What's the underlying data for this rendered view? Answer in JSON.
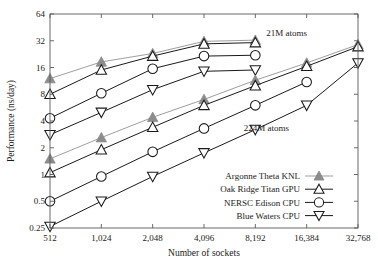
{
  "chart_data": {
    "type": "line",
    "title": "",
    "xlabel": "Number of sockets",
    "ylabel": "Performance (ns/day)",
    "xscale": "log2",
    "yscale": "log2",
    "xlim": [
      512,
      32768
    ],
    "ylim": [
      0.25,
      64
    ],
    "grid": false,
    "legend_position": "lower-right",
    "xticks": [
      512,
      1024,
      2048,
      4096,
      8192,
      16384,
      32768
    ],
    "xtick_labels": [
      "512",
      "1,024",
      "2,048",
      "4,096",
      "8,192",
      "16,384",
      "32,768"
    ],
    "yticks": [
      0.25,
      0.5,
      1,
      2,
      4,
      8,
      16,
      32,
      64
    ],
    "ytick_labels": [
      "0.25",
      "0.5",
      "1",
      "2",
      "4",
      "8",
      "16",
      "32",
      "64"
    ],
    "annotations": [
      {
        "text": "21M atoms",
        "x": 9500,
        "y": 36
      },
      {
        "text": "224M atoms",
        "x": 7000,
        "y": 3.1
      }
    ],
    "series": [
      {
        "name": "Argonne Theta KNL",
        "marker": "filled-triangle-up",
        "color": "#8c8c8c",
        "dataset": "21M atoms",
        "x": [
          512,
          1024,
          2048,
          4096,
          8192
        ],
        "y": [
          12.0,
          18.5,
          23.0,
          31.5,
          32.5
        ]
      },
      {
        "name": "Oak Ridge Titan GPU",
        "marker": "open-triangle-up",
        "color": "#1a1a1a",
        "dataset": "21M atoms",
        "x": [
          512,
          1024,
          2048,
          4096,
          8192
        ],
        "y": [
          8.0,
          15.0,
          21.5,
          29.5,
          30.5
        ]
      },
      {
        "name": "NERSC Edison CPU",
        "marker": "open-circle",
        "color": "#1a1a1a",
        "dataset": "21M atoms",
        "x": [
          512,
          1024,
          2048,
          4096,
          8192
        ],
        "y": [
          4.3,
          8.2,
          15.5,
          21.5,
          22.0
        ]
      },
      {
        "name": "Blue Waters CPU",
        "marker": "open-triangle-down",
        "color": "#1a1a1a",
        "dataset": "21M atoms",
        "x": [
          512,
          1024,
          2048,
          4096,
          8192
        ],
        "y": [
          2.8,
          5.0,
          9.0,
          14.5,
          15.0
        ]
      },
      {
        "name": "Argonne Theta KNL",
        "marker": "filled-triangle-up",
        "color": "#8c8c8c",
        "dataset": "224M atoms",
        "x": [
          512,
          1024,
          2048,
          4096,
          8192,
          16384,
          32768
        ],
        "y": [
          1.5,
          2.6,
          4.4,
          7.0,
          11.5,
          18.0,
          29.0
        ]
      },
      {
        "name": "Oak Ridge Titan GPU",
        "marker": "open-triangle-up",
        "color": "#1a1a1a",
        "dataset": "224M atoms",
        "x": [
          512,
          1024,
          2048,
          4096,
          8192,
          16384,
          32768
        ],
        "y": [
          1.05,
          1.9,
          3.4,
          6.0,
          10.0,
          16.5,
          27.5
        ]
      },
      {
        "name": "NERSC Edison CPU",
        "marker": "open-circle",
        "color": "#1a1a1a",
        "dataset": "224M atoms",
        "x": [
          512,
          1024,
          2048,
          4096,
          8192,
          16384
        ],
        "y": [
          0.5,
          0.95,
          1.8,
          3.3,
          6.0,
          11.0
        ]
      },
      {
        "name": "Blue Waters CPU",
        "marker": "open-triangle-down",
        "color": "#1a1a1a",
        "dataset": "224M atoms",
        "x": [
          512,
          1024,
          2048,
          4096,
          8192,
          16384,
          32768
        ],
        "y": [
          0.26,
          0.5,
          0.95,
          1.75,
          3.2,
          6.0,
          18.0
        ]
      }
    ],
    "legend": [
      {
        "label": "Argonne Theta KNL",
        "marker": "filled-triangle-up",
        "color": "#8c8c8c"
      },
      {
        "label": "Oak Ridge Titan GPU",
        "marker": "open-triangle-up",
        "color": "#1a1a1a"
      },
      {
        "label": "NERSC Edison CPU",
        "marker": "open-circle",
        "color": "#1a1a1a"
      },
      {
        "label": "Blue Waters CPU",
        "marker": "open-triangle-down",
        "color": "#1a1a1a"
      }
    ]
  }
}
